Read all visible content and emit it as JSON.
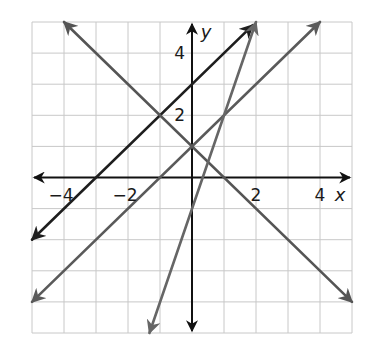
{
  "chart_data": {
    "type": "line",
    "title": "",
    "xlabel": "x",
    "ylabel": "y",
    "xlim": [
      -5,
      5
    ],
    "ylim": [
      -5,
      5
    ],
    "grid": true,
    "x_ticks_labeled": [
      -4,
      -2,
      2,
      4
    ],
    "y_ticks_labeled": [
      2,
      4
    ],
    "tick_labels": {
      "x": [
        "−4",
        "−2",
        "2",
        "4"
      ],
      "y": [
        "2",
        "4"
      ]
    },
    "series": [
      {
        "name": "y = x + 3",
        "slope": 1,
        "intercept": 3,
        "color": "#1e1e1e",
        "points": [
          [
            -5,
            -2
          ],
          [
            -3,
            0
          ],
          [
            -1,
            2
          ],
          [
            0,
            3
          ],
          [
            1.9,
            4.9
          ]
        ]
      },
      {
        "name": "y = -x + 1",
        "slope": -1,
        "intercept": 1,
        "color": "#555555",
        "points": [
          [
            -4,
            5
          ],
          [
            -1,
            2
          ],
          [
            0,
            1
          ],
          [
            1,
            0
          ],
          [
            5,
            -4
          ]
        ]
      },
      {
        "name": "y = x + 1",
        "slope": 1,
        "intercept": 1,
        "color": "#5a5a5a",
        "points": [
          [
            -5,
            -4
          ],
          [
            -1,
            0
          ],
          [
            0,
            1
          ],
          [
            1,
            2
          ],
          [
            4,
            5
          ]
        ]
      },
      {
        "name": "y = 3x - 1",
        "slope": 3,
        "intercept": -1,
        "color": "#666666",
        "points": [
          [
            -1.33,
            -5
          ],
          [
            0,
            -1
          ],
          [
            1,
            2
          ],
          [
            2,
            5
          ]
        ]
      }
    ],
    "intersections": [
      [
        -1,
        2
      ],
      [
        0,
        1
      ],
      [
        1,
        2
      ]
    ],
    "annotations": []
  },
  "colors": {
    "grid": "#c8c8c8",
    "axes": "#111111",
    "background": "#ffffff"
  }
}
